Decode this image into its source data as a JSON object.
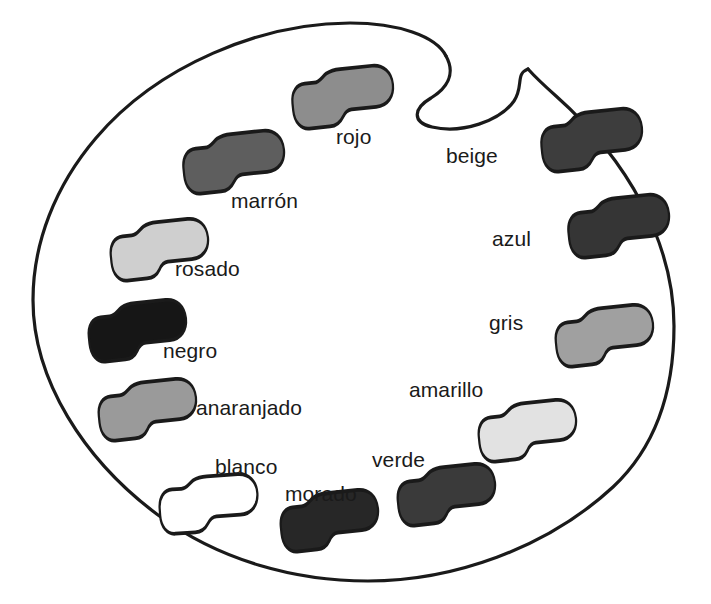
{
  "diagram": {
    "language": "es",
    "style": "grayscale line drawing",
    "background_color": "#ffffff",
    "outline_color": "#1a1a1a",
    "outline_width_px": 3,
    "label_color": "#1a1a1a",
    "label_font_size_px": 21
  },
  "palette": {
    "name": "paint-palette",
    "has_thumb_hole": true,
    "thumb_hole_position": "top-center-right",
    "outline_path": "M 446 56 C 437 39, 404 24, 352 24 C 247 24, 140 76, 84 156 C 52 202, 36 253, 36 302 C 36 436, 181 578, 366 578 C 524 578, 672 460, 672 316 C 672 204, 600 111, 528 69",
    "thumb_path": "M 446 56 C 455 76, 436 96, 421 104 C 404 113, 420 128, 444 128 C 480 128, 510 112, 518 94 C 525 79, 517 70, 528 69"
  },
  "blobs": [
    {
      "id": "rojo",
      "label": "rojo",
      "fill": "#8d8d8d",
      "tone": "medium-gray",
      "blob_x": 272,
      "blob_y": 70,
      "blob_w": 122,
      "blob_h": 56,
      "rotation_deg": -6,
      "label_x": 336,
      "label_y": 126
    },
    {
      "id": "beige",
      "label": "beige",
      "fill": "#3d3d3d",
      "tone": "dark-gray",
      "blob_x": 521,
      "blob_y": 113,
      "blob_w": 122,
      "blob_h": 56,
      "rotation_deg": -6,
      "label_x": 446,
      "label_y": 145
    },
    {
      "id": "marron",
      "label": "marrón",
      "fill": "#5e5e5e",
      "tone": "dark-medium-gray",
      "blob_x": 163,
      "blob_y": 135,
      "blob_w": 122,
      "blob_h": 56,
      "rotation_deg": -6,
      "label_x": 231,
      "label_y": 190
    },
    {
      "id": "azul",
      "label": "azul",
      "fill": "#353535",
      "tone": "very-dark-gray",
      "blob_x": 548,
      "blob_y": 199,
      "blob_w": 122,
      "blob_h": 56,
      "rotation_deg": -6,
      "label_x": 492,
      "label_y": 228
    },
    {
      "id": "rosado",
      "label": "rosado",
      "fill": "#cfcfcf",
      "tone": "light-gray",
      "blob_x": 91,
      "blob_y": 223,
      "blob_w": 118,
      "blob_h": 55,
      "rotation_deg": -6,
      "label_x": 175,
      "label_y": 258
    },
    {
      "id": "gris",
      "label": "gris",
      "fill": "#a0a0a0",
      "tone": "gray",
      "blob_x": 536,
      "blob_y": 309,
      "blob_w": 118,
      "blob_h": 55,
      "rotation_deg": -6,
      "label_x": 489,
      "label_y": 312
    },
    {
      "id": "negro",
      "label": "negro",
      "fill": "#161616",
      "tone": "black",
      "blob_x": 69,
      "blob_y": 304,
      "blob_w": 118,
      "blob_h": 55,
      "rotation_deg": -6,
      "label_x": 163,
      "label_y": 340
    },
    {
      "id": "amarillo",
      "label": "amarillo",
      "fill": "#e2e2e2",
      "tone": "very-light-gray",
      "blob_x": 459,
      "blob_y": 404,
      "blob_w": 118,
      "blob_h": 55,
      "rotation_deg": -6,
      "label_x": 409,
      "label_y": 379
    },
    {
      "id": "anaranjado",
      "label": "anaranjado",
      "fill": "#9a9a9a",
      "tone": "medium-gray",
      "blob_x": 79,
      "blob_y": 383,
      "blob_w": 118,
      "blob_h": 55,
      "rotation_deg": -6,
      "label_x": 196,
      "label_y": 397
    },
    {
      "id": "verde",
      "label": "verde",
      "fill": "#3a3a3a",
      "tone": "dark-gray",
      "blob_x": 378,
      "blob_y": 468,
      "blob_w": 118,
      "blob_h": 55,
      "rotation_deg": -6,
      "label_x": 372,
      "label_y": 449
    },
    {
      "id": "blanco",
      "label": "blanco",
      "fill": "#ffffff",
      "tone": "white",
      "blob_x": 140,
      "blob_y": 477,
      "blob_w": 118,
      "blob_h": 55,
      "rotation_deg": -4,
      "label_x": 215,
      "label_y": 456
    },
    {
      "id": "morado",
      "label": "morado",
      "fill": "#272727",
      "tone": "very-dark-gray",
      "blob_x": 261,
      "blob_y": 494,
      "blob_w": 118,
      "blob_h": 55,
      "rotation_deg": -6,
      "label_x": 285,
      "label_y": 483
    }
  ]
}
